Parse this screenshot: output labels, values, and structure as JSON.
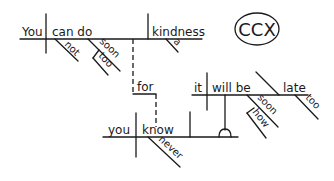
{
  "diagram": {
    "type": "sentence-diagram",
    "logo": "CCX",
    "main_clause": {
      "subject": "You",
      "verb": "can do",
      "object": "kindness",
      "modifiers": {
        "not": "not",
        "soon": "soon",
        "too": "too",
        "a": "a"
      }
    },
    "connector": "for",
    "sub_clause": {
      "subject": "you",
      "verb": "know",
      "modifiers": {
        "never": "never"
      }
    },
    "noun_clause": {
      "subject": "it",
      "verb": "will be",
      "complement": "late",
      "modifiers": {
        "soon": "soon",
        "how": "how",
        "too": "too"
      }
    }
  }
}
